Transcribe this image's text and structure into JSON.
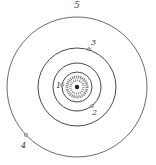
{
  "figure_label": "5",
  "center": {
    "name": "sun"
  },
  "orbits": [
    {
      "id": "orbit-1",
      "label": "1"
    },
    {
      "id": "orbit-2",
      "label": "2"
    },
    {
      "id": "orbit-3",
      "label": "3"
    },
    {
      "id": "orbit-4",
      "label": "4"
    }
  ],
  "colors": {
    "ink": "#333333",
    "paper": "#ffffff"
  }
}
